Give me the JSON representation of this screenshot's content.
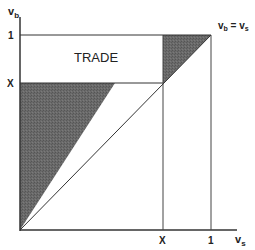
{
  "diagram": {
    "y_axis_label": "v",
    "y_axis_subscript": "b",
    "x_axis_label": "v",
    "x_axis_subscript": "s",
    "y_ticks": [
      {
        "label": "1",
        "value": 1
      },
      {
        "label": "X",
        "value": "X"
      }
    ],
    "x_ticks": [
      {
        "label": "X",
        "value": "X"
      },
      {
        "label": "1",
        "value": 1
      }
    ],
    "diagonal_label": "v_b = v_s",
    "diagonal_label_parts": {
      "a": "v",
      "a_sub": "b",
      "eq": " = ",
      "b": "v",
      "b_sub": "s"
    },
    "region_label": "TRADE",
    "shaded_regions": [
      "lower-left triangle: 0 ≤ v_s ≤ v_b ≤ X",
      "upper-right triangle: X ≤ v_s ≤ v_b ≤ 1"
    ],
    "colors": {
      "shade": "#6a6a6a",
      "line": "#333333",
      "background": "#ffffff"
    }
  }
}
